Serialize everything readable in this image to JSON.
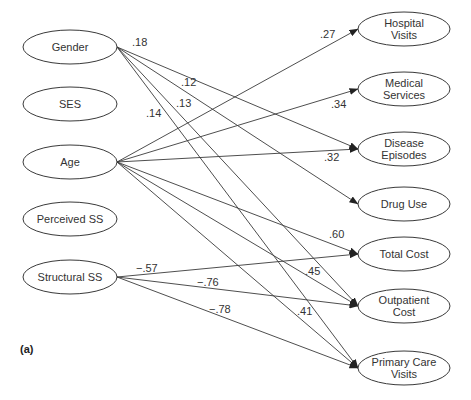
{
  "diagram": {
    "panel_label": "(a)",
    "colors": {
      "stroke": "#3a3a3a",
      "text": "#333333",
      "background": "#ffffff"
    },
    "left_nodes": [
      {
        "id": "gender",
        "lines": [
          "Gender"
        ],
        "cx": 70,
        "cy": 47
      },
      {
        "id": "ses",
        "lines": [
          "SES"
        ],
        "cx": 70,
        "cy": 104
      },
      {
        "id": "age",
        "lines": [
          "Age"
        ],
        "cx": 70,
        "cy": 162
      },
      {
        "id": "perceived_ss",
        "lines": [
          "Perceived SS"
        ],
        "cx": 70,
        "cy": 219
      },
      {
        "id": "structural_ss",
        "lines": [
          "Structural SS"
        ],
        "cx": 70,
        "cy": 277
      }
    ],
    "right_nodes": [
      {
        "id": "hospital_visits",
        "lines": [
          "Hospital",
          "Visits"
        ],
        "cx": 404,
        "cy": 29
      },
      {
        "id": "medical_services",
        "lines": [
          "Medical",
          "Services"
        ],
        "cx": 404,
        "cy": 89
      },
      {
        "id": "disease_episodes",
        "lines": [
          "Disease",
          "Episodes"
        ],
        "cx": 404,
        "cy": 149
      },
      {
        "id": "drug_use",
        "lines": [
          "Drug Use"
        ],
        "cx": 404,
        "cy": 204
      },
      {
        "id": "total_cost",
        "lines": [
          "Total Cost"
        ],
        "cx": 404,
        "cy": 254
      },
      {
        "id": "outpatient_cost",
        "lines": [
          "Outpatient",
          "Cost"
        ],
        "cx": 404,
        "cy": 306
      },
      {
        "id": "primary_care_visits",
        "lines": [
          "Primary Care",
          "Visits"
        ],
        "cx": 404,
        "cy": 368
      }
    ],
    "edges": [
      {
        "from": "gender",
        "to": "disease_episodes",
        "coef": ".18",
        "lx": 132,
        "ly": 46
      },
      {
        "from": "gender",
        "to": "drug_use",
        "coef": ".12",
        "lx": 181,
        "ly": 86
      },
      {
        "from": "gender",
        "to": "outpatient_cost",
        "coef": ".13",
        "lx": 176,
        "ly": 107
      },
      {
        "from": "gender",
        "to": "primary_care_visits",
        "coef": ".14",
        "lx": 146,
        "ly": 117
      },
      {
        "from": "age",
        "to": "hospital_visits",
        "coef": ".27",
        "lx": 320,
        "ly": 38
      },
      {
        "from": "age",
        "to": "medical_services",
        "coef": ".34",
        "lx": 331,
        "ly": 108
      },
      {
        "from": "age",
        "to": "disease_episodes",
        "coef": ".32",
        "lx": 324,
        "ly": 161
      },
      {
        "from": "age",
        "to": "total_cost",
        "coef": ".60",
        "lx": 329,
        "ly": 238
      },
      {
        "from": "age",
        "to": "outpatient_cost",
        "coef": ".45",
        "lx": 305,
        "ly": 275
      },
      {
        "from": "age",
        "to": "primary_care_visits",
        "coef": ".41",
        "lx": 297,
        "ly": 315
      },
      {
        "from": "structural_ss",
        "to": "total_cost",
        "coef": "−.57",
        "lx": 136,
        "ly": 272
      },
      {
        "from": "structural_ss",
        "to": "outpatient_cost",
        "coef": "−.76",
        "lx": 197,
        "ly": 286
      },
      {
        "from": "structural_ss",
        "to": "primary_care_visits",
        "coef": "−.78",
        "lx": 209,
        "ly": 313
      }
    ]
  }
}
